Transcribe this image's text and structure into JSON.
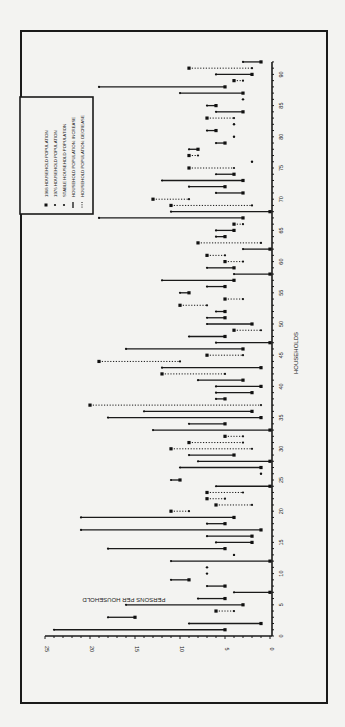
{
  "chart_data": {
    "type": "scatter",
    "orientation": "rotated-90",
    "title": "",
    "xlabel": "HOUSEHOLDS",
    "ylabel": "PERSONS PER HOUSEHOLD",
    "xlim": [
      0,
      92
    ],
    "ylim": [
      0,
      25
    ],
    "x_ticks": [
      0,
      5,
      10,
      15,
      20,
      25,
      30,
      35,
      40,
      45,
      50,
      55,
      60,
      65,
      70,
      75,
      80,
      85,
      90
    ],
    "y_ticks": [
      0,
      5,
      10,
      15,
      20,
      25
    ],
    "grid": false,
    "legend_position": "upper-left (rotated)",
    "legend": [
      {
        "symbol": "large-dot",
        "label": "1968 HOUSEHOLD POPULATION"
      },
      {
        "symbol": "small-dot",
        "label": "1976 HOUSEHOLD POPULATION"
      },
      {
        "symbol": "small-dot",
        "label": "STABLE HOUSEHOLD POPULATION"
      },
      {
        "symbol": "solid-line",
        "label": "HOUSEHOLD POPULATION: INCREASE"
      },
      {
        "symbol": "dotted-line",
        "label": "HOUSEHOLD POPULATION: DECREASE"
      }
    ],
    "series": [
      {
        "name": "1968 HOUSEHOLD POPULATION",
        "x": [
          1,
          2,
          3,
          4,
          5,
          6,
          7,
          8,
          9,
          10,
          11,
          12,
          13,
          14,
          15,
          16,
          17,
          18,
          19,
          20,
          21,
          22,
          23,
          24,
          25,
          26,
          27,
          28,
          29,
          30,
          31,
          32,
          33,
          34,
          35,
          36,
          37,
          38,
          39,
          40,
          41,
          42,
          43,
          44,
          45,
          46,
          47,
          48,
          49,
          50,
          51,
          52,
          53,
          54,
          55,
          56,
          57,
          58,
          59,
          60,
          61,
          62,
          63,
          64,
          65,
          66,
          67,
          68,
          69,
          70,
          71,
          72,
          73,
          74,
          75,
          76,
          77,
          78,
          79,
          80,
          81,
          82,
          83,
          84,
          85,
          86,
          87,
          88,
          89,
          90,
          91,
          92
        ],
        "values": [
          5,
          1,
          15,
          6,
          3,
          5,
          0,
          5,
          9,
          7,
          7,
          0,
          4,
          5,
          2,
          2,
          1,
          5,
          4,
          11,
          6,
          7,
          7,
          0,
          10,
          1,
          1,
          0,
          4,
          11,
          9,
          5,
          0,
          5,
          1,
          2,
          20,
          5,
          2,
          1,
          3,
          12,
          1,
          19,
          7,
          3,
          0,
          5,
          4,
          2,
          5,
          5,
          10,
          5,
          9,
          5,
          4,
          0,
          4,
          5,
          7,
          0,
          8,
          5,
          4,
          4,
          3,
          0,
          11,
          13,
          3,
          5,
          3,
          4,
          9,
          2,
          9,
          8,
          5,
          4,
          6,
          4,
          7,
          3,
          6,
          3,
          3,
          5,
          4,
          2,
          9,
          1
        ]
      },
      {
        "name": "1976 HOUSEHOLD POPULATION",
        "x": [
          1,
          2,
          3,
          4,
          5,
          6,
          7,
          8,
          9,
          10,
          11,
          12,
          13,
          14,
          15,
          16,
          17,
          18,
          19,
          20,
          21,
          22,
          23,
          24,
          25,
          26,
          27,
          28,
          29,
          30,
          31,
          32,
          33,
          34,
          35,
          36,
          37,
          38,
          39,
          40,
          41,
          42,
          43,
          44,
          45,
          46,
          47,
          48,
          49,
          50,
          51,
          52,
          53,
          54,
          55,
          56,
          57,
          58,
          59,
          60,
          61,
          62,
          63,
          64,
          65,
          66,
          67,
          68,
          69,
          70,
          71,
          72,
          73,
          74,
          75,
          76,
          77,
          78,
          79,
          80,
          81,
          82,
          83,
          84,
          85,
          86,
          87,
          88,
          89,
          90,
          91,
          92
        ],
        "values": [
          24,
          9,
          18,
          4,
          16,
          8,
          4,
          7,
          11,
          7,
          7,
          11,
          4,
          18,
          6,
          7,
          21,
          7,
          21,
          9,
          2,
          5,
          3,
          6,
          11,
          1,
          10,
          8,
          9,
          2,
          3,
          3,
          13,
          9,
          18,
          14,
          1,
          6,
          6,
          6,
          8,
          5,
          12,
          10,
          3,
          16,
          6,
          9,
          1,
          7,
          7,
          6,
          7,
          3,
          10,
          7,
          12,
          4,
          7,
          3,
          5,
          3,
          1,
          6,
          6,
          3,
          19,
          11,
          2,
          9,
          6,
          9,
          12,
          6,
          4,
          2,
          8,
          9,
          6,
          4,
          7,
          4,
          4,
          6,
          7,
          3,
          10,
          19,
          3,
          6,
          2,
          3
        ]
      }
    ],
    "stable_households": [
      10,
      11,
      13,
      26,
      76,
      80,
      82,
      86
    ]
  },
  "labels": {
    "x_axis": "HOUSEHOLDS",
    "y_axis": "PERSONS PER HOUSEHOLD"
  }
}
